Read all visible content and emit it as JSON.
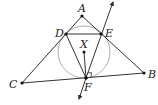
{
  "diagram": {
    "type": "geometry",
    "points": {
      "A": {
        "label": "A",
        "x": 82,
        "y": 16
      },
      "B": {
        "label": "B",
        "x": 144,
        "y": 73
      },
      "C": {
        "label": "C",
        "x": 22,
        "y": 83
      },
      "D": {
        "label": "D",
        "x": 66,
        "y": 34
      },
      "E": {
        "label": "E",
        "x": 101,
        "y": 34
      },
      "F": {
        "label": "F",
        "x": 86,
        "y": 78
      },
      "X": {
        "label": "X",
        "x": 84,
        "y": 52
      }
    },
    "circle": {
      "center": "X",
      "radius": 26,
      "color": "#b0b0b0"
    },
    "segments": [
      "AB",
      "AC",
      "CB",
      "DE",
      "DF",
      "EF",
      "XF"
    ],
    "lines": [
      {
        "through": [
          "F",
          "E"
        ],
        "arrows": "both"
      }
    ],
    "right_angle_at": "F",
    "line_color": "#333333"
  }
}
